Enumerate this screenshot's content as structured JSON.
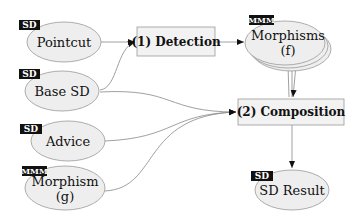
{
  "diagram": {
    "colors": {
      "node_fill": "#eeeeee",
      "node_stroke": "#999999",
      "edge": "#777777",
      "tag_bg": "#111111",
      "tag_text": "#ffffff"
    },
    "inputs": [
      {
        "id": "pointcut",
        "label": "Pointcut",
        "tag": "SD"
      },
      {
        "id": "base-sd",
        "label": "Base SD",
        "tag": "SD"
      },
      {
        "id": "advice",
        "label": "Advice",
        "tag": "SD"
      },
      {
        "id": "morphism-g",
        "label_line1": "Morphism",
        "label_line2": "(g)",
        "tag": "MMM"
      }
    ],
    "processes": [
      {
        "id": "detection",
        "label": "(1) Detection"
      },
      {
        "id": "composition",
        "label": "(2) Composition"
      }
    ],
    "intermediate": {
      "id": "morphisms-f",
      "label_line1": "Morphisms",
      "label_line2": "(f)",
      "tag": "MMM"
    },
    "output": {
      "id": "sd-result",
      "label": "SD Result",
      "tag": "SD"
    }
  }
}
